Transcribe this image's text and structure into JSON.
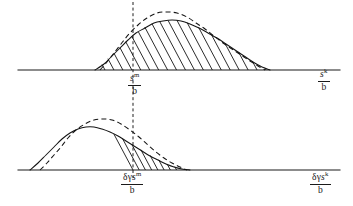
{
  "figure": {
    "background_color": "#ffffff",
    "ink_color": "#1a1a1a"
  },
  "labels": {
    "upper_mid": {
      "name": "upper-mid-axis-label",
      "numerator_base": "s",
      "numerator_sup": "m",
      "denominator": "b",
      "plain": "s^m / b"
    },
    "upper_right": {
      "name": "upper-right-axis-label",
      "numerator_base": "s",
      "numerator_sup": "k",
      "denominator": "b",
      "plain": "s^k / b"
    },
    "lower_mid": {
      "name": "lower-mid-axis-label",
      "numerator_prefix": "δγ",
      "numerator_base": "s",
      "numerator_sup": "m",
      "denominator": "b",
      "plain": "δγs^m / b"
    },
    "lower_right": {
      "name": "lower-right-axis-label",
      "numerator_prefix": "δγ",
      "numerator_base": "s",
      "numerator_sup": "k",
      "denominator": "b",
      "plain": "δγs^k / b"
    }
  },
  "chart_data": {
    "type": "line",
    "title": "",
    "xlabel": "",
    "ylabel": "",
    "grid": false,
    "legend": "none",
    "panels": [
      {
        "id": "upper-panel",
        "name": "upper-distribution-plot",
        "baseline_y": 70,
        "axis_x_start": 18,
        "axis_x_end": 340,
        "reference_line_x": 133,
        "reference_label": "s^m / b",
        "axis_end_label": "s^k / b",
        "series": [
          {
            "name": "solid-curve",
            "style": "solid",
            "points": [
              [
                95,
                70
              ],
              [
                104,
                64
              ],
              [
                112,
                56
              ],
              [
                120,
                48
              ],
              [
                128,
                40
              ],
              [
                136,
                33
              ],
              [
                145,
                28
              ],
              [
                154,
                23
              ],
              [
                163,
                21
              ],
              [
                172,
                20
              ],
              [
                181,
                21
              ],
              [
                190,
                24
              ],
              [
                199,
                28
              ],
              [
                208,
                33
              ],
              [
                217,
                38
              ],
              [
                226,
                44
              ],
              [
                235,
                50
              ],
              [
                244,
                56
              ],
              [
                253,
                62
              ],
              [
                262,
                67
              ],
              [
                270,
                70
              ]
            ]
          },
          {
            "name": "dashed-curve",
            "style": "dashed",
            "points": [
              [
                100,
                70
              ],
              [
                107,
                62
              ],
              [
                114,
                53
              ],
              [
                121,
                44
              ],
              [
                129,
                34
              ],
              [
                138,
                25
              ],
              [
                147,
                18
              ],
              [
                157,
                13
              ],
              [
                167,
                12
              ],
              [
                177,
                13
              ],
              [
                187,
                17
              ],
              [
                196,
                23
              ],
              [
                205,
                29
              ],
              [
                214,
                36
              ],
              [
                223,
                43
              ],
              [
                232,
                49
              ],
              [
                241,
                55
              ],
              [
                250,
                61
              ],
              [
                258,
                66
              ],
              [
                265,
                70
              ]
            ]
          }
        ],
        "hatching": {
          "name": "upper-hatch-fill",
          "x_start": 105,
          "x_end": 266,
          "angle_deg": 62,
          "line_count": 18
        }
      },
      {
        "id": "lower-panel",
        "name": "lower-distribution-plot",
        "baseline_y": 170,
        "axis_x_start": 18,
        "axis_x_end": 340,
        "reference_line_x": 133,
        "reference_label": "δγs^m / b",
        "axis_end_label": "δγs^k / b",
        "series": [
          {
            "name": "solid-curve",
            "style": "solid",
            "points": [
              [
                30,
                170
              ],
              [
                38,
                163
              ],
              [
                46,
                155
              ],
              [
                54,
                147
              ],
              [
                62,
                139
              ],
              [
                70,
                133
              ],
              [
                78,
                129
              ],
              [
                86,
                127
              ],
              [
                94,
                127
              ],
              [
                102,
                129
              ],
              [
                110,
                132
              ],
              [
                118,
                136
              ],
              [
                126,
                141
              ],
              [
                134,
                146
              ],
              [
                142,
                151
              ],
              [
                150,
                156
              ],
              [
                158,
                160
              ],
              [
                166,
                164
              ],
              [
                174,
                167
              ],
              [
                182,
                169
              ],
              [
                190,
                170
              ]
            ]
          },
          {
            "name": "dashed-curve",
            "style": "dashed",
            "points": [
              [
                40,
                170
              ],
              [
                47,
                163
              ],
              [
                54,
                155
              ],
              [
                61,
                147
              ],
              [
                68,
                138
              ],
              [
                76,
                130
              ],
              [
                85,
                124
              ],
              [
                94,
                120
              ],
              [
                103,
                119
              ],
              [
                112,
                120
              ],
              [
                121,
                124
              ],
              [
                130,
                130
              ],
              [
                139,
                137
              ],
              [
                148,
                145
              ],
              [
                156,
                152
              ],
              [
                164,
                158
              ],
              [
                172,
                163
              ],
              [
                180,
                167
              ],
              [
                187,
                170
              ]
            ]
          }
        ],
        "hatching": {
          "name": "lower-hatch-fill",
          "x_start": 133,
          "x_end": 189,
          "angle_deg": 62,
          "line_count": 9
        }
      }
    ],
    "reference_line": {
      "name": "vertical-reference-line",
      "x": 133,
      "y_top": 2,
      "y_bottom": 178,
      "style": "dashed"
    }
  }
}
